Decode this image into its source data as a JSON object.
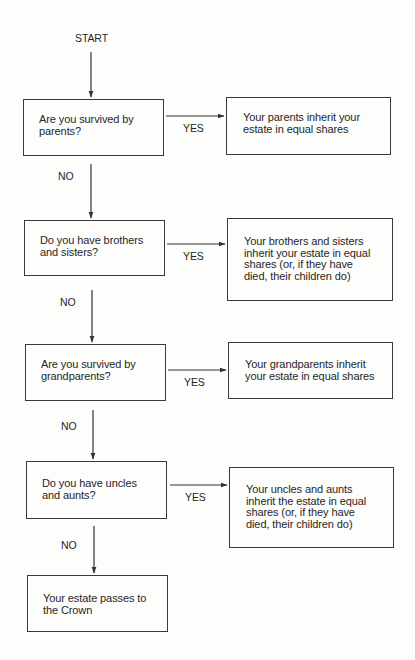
{
  "diagram": {
    "type": "flowchart",
    "start_label": "START",
    "yes_label": "YES",
    "no_label": "NO",
    "line_color": "#333333",
    "steps": [
      {
        "question": "Are you survived by\nparents?",
        "outcome": "Your parents inherit your\nestate in equal shares"
      },
      {
        "question": "Do you have brothers\nand sisters?",
        "outcome": "Your brothers and sisters\ninherit your estate in equal\nshares (or, if they have\ndied, their children do)"
      },
      {
        "question": "Are you survived by\ngrandparents?",
        "outcome": "Your grandparents inherit\nyour estate in equal shares"
      },
      {
        "question": "Do you have uncles\nand aunts?",
        "outcome": "Your uncles and aunts\ninherit the estate in equal\nshares (or, if they have\ndied, their children do)"
      }
    ],
    "final": "Your estate passes to\nthe Crown"
  }
}
